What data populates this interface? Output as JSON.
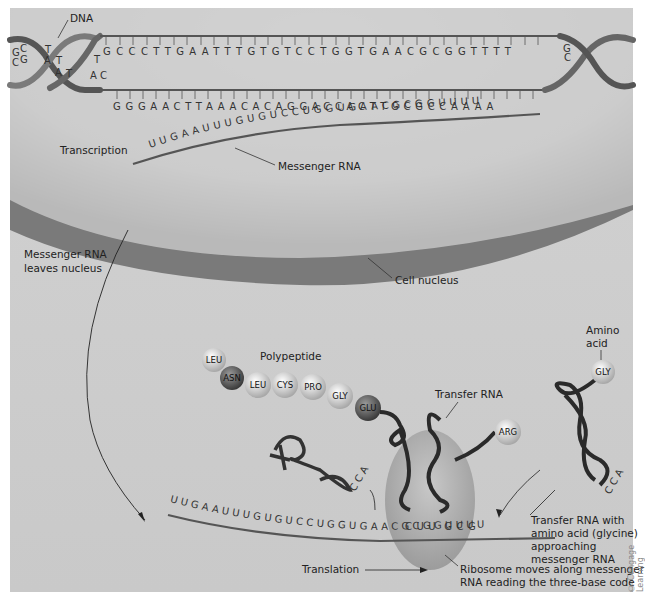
{
  "labels": {
    "dna": "DNA",
    "transcription": "Transcription",
    "messenger_rna": "Messenger RNA",
    "mrna_leaves_1": "Messenger RNA",
    "mrna_leaves_2": "leaves nucleus",
    "cell_nucleus": "Cell nucleus",
    "polypeptide": "Polypeptide",
    "transfer_rna": "Transfer RNA",
    "amino_acid_1": "Amino",
    "amino_acid_2": "acid",
    "trna_approach_1": "Transfer RNA with",
    "trna_approach_2": "amino acid (glycine)",
    "trna_approach_3": "approaching",
    "trna_approach_4": "messenger RNA",
    "translation": "Translation",
    "ribosome_1": "Ribosome moves along messenger",
    "ribosome_2": "RNA reading the three-base code",
    "credit": "© Cengage Learning"
  },
  "dna": {
    "helix_left_top": [
      "G",
      "C",
      "T",
      "T"
    ],
    "helix_left_bottom": [
      "C",
      "G",
      "A",
      "A",
      "T",
      "A",
      "C"
    ],
    "top_strand": "GCCCTTGAATTTGTGTCCTGGTGAACGCGGTTTT",
    "bottom_strand": "GGGAACTTAAACACAGGACCACTTGCGCCAAAA",
    "helix_right": [
      "G",
      "C"
    ]
  },
  "transcription_mrna": "UUGAAUUUGUGUCCUGGUGAACGCGGUUUU",
  "polypeptide": [
    "LEU",
    "ASN",
    "LEU",
    "CYS",
    "PRO",
    "GLY",
    "GLU"
  ],
  "amino_acids": {
    "arg": "ARG",
    "gly": "GLY"
  },
  "trna_cca": [
    "C",
    "C",
    "A"
  ],
  "anticodons": [
    "C",
    "U",
    "U",
    "G",
    "C",
    "G"
  ],
  "translation_mrna": "UUGAAUUUGUGUCCUGGUGAACGCGGUUUU"
}
